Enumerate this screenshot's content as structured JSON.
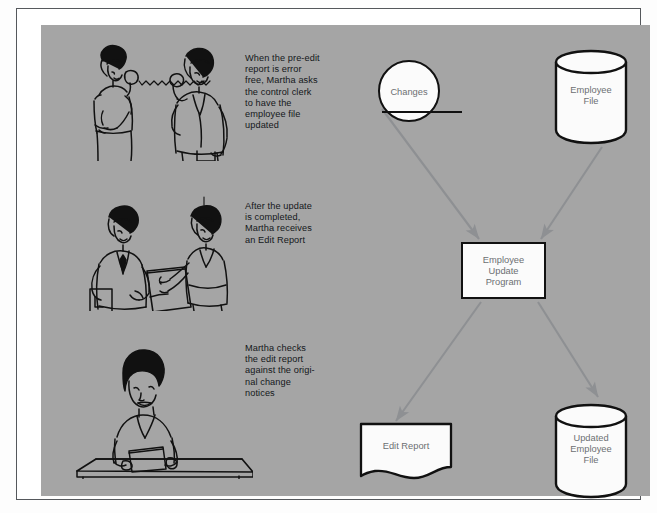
{
  "page": {
    "background": "#ffffff",
    "panel_color": "#a5a5a5",
    "frame_color": "#55585c",
    "ink_color": "#111111",
    "label_color": "#6c6f72",
    "caption_color": "#14171a",
    "arrow_color": "#8e9093"
  },
  "captions": [
    {
      "id": "caption-1",
      "text": "When the pre-edit\nreport is error\nfree, Martha asks\nthe control clerk\nto have the\nemployee file\nupdated"
    },
    {
      "id": "caption-2",
      "text": "After the update\nis completed,\nMartha receives\nan Edit Report"
    },
    {
      "id": "caption-3",
      "text": "Martha checks\nthe edit report\nagainst the origi-\nnal change\nnotices"
    }
  ],
  "illustrations": [
    {
      "id": "illustration-phone-call",
      "description": "woman and man talking on telephones connected by a cord"
    },
    {
      "id": "illustration-handing-report",
      "description": "man holding a folder handing a report to a woman"
    },
    {
      "id": "illustration-desk-review",
      "description": "woman seated at a desk reviewing a printed report"
    }
  ],
  "flowchart": {
    "nodes": [
      {
        "id": "changes",
        "label": "Changes",
        "shape": "circle-manual-input"
      },
      {
        "id": "employee-file",
        "label": "Employee\nFile",
        "shape": "cylinder"
      },
      {
        "id": "update-program",
        "label": "Employee\nUpdate\nProgram",
        "shape": "process-rectangle"
      },
      {
        "id": "edit-report",
        "label": "Edit Report",
        "shape": "document"
      },
      {
        "id": "updated-file",
        "label": "Updated\nEmployee\nFile",
        "shape": "cylinder"
      }
    ],
    "connectors": [
      {
        "id": "arrow-changes-to-program",
        "from": "changes",
        "to": "update-program"
      },
      {
        "id": "arrow-employee-file-to-program",
        "from": "employee-file",
        "to": "update-program"
      },
      {
        "id": "arrow-program-to-edit-report",
        "from": "update-program",
        "to": "edit-report"
      },
      {
        "id": "arrow-program-to-updated-file",
        "from": "update-program",
        "to": "updated-file"
      }
    ]
  }
}
